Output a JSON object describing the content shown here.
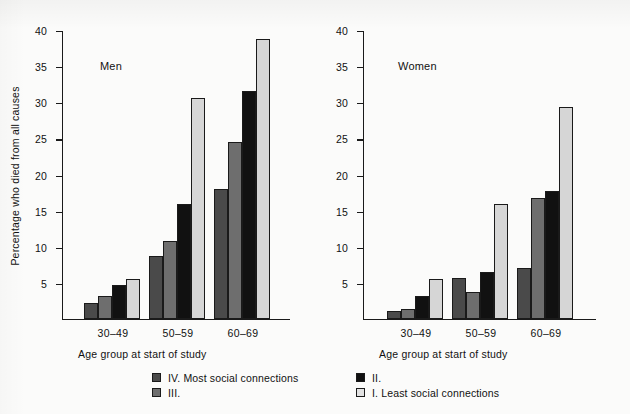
{
  "chart_data": {
    "type": "bar",
    "title": "",
    "xlabel": "Age group at start of study",
    "ylabel": "Percentage who died from all causes",
    "categories": [
      "30–49",
      "50–59",
      "60–69"
    ],
    "ylim": [
      0,
      40
    ],
    "yticks": [
      0,
      5,
      10,
      15,
      20,
      25,
      30,
      35,
      40
    ],
    "ytick_labels": [
      "",
      "5",
      "10",
      "15",
      "20",
      "25",
      "30",
      "35",
      "40"
    ],
    "grid": false,
    "legend_position": "bottom",
    "panels": [
      {
        "name": "Men",
        "series": [
          {
            "name": "IV. Most social connections",
            "values": [
              2.2,
              8.6,
              18.0
            ]
          },
          {
            "name": "III.",
            "values": [
              3.1,
              10.8,
              24.5
            ]
          },
          {
            "name": "II.",
            "values": [
              4.6,
              15.9,
              31.5
            ]
          },
          {
            "name": "I. Least social connections",
            "values": [
              5.5,
              30.5,
              38.7
            ]
          }
        ]
      },
      {
        "name": "Women",
        "series": [
          {
            "name": "IV. Most social connections",
            "values": [
              1.0,
              5.6,
              7.0
            ]
          },
          {
            "name": "III.",
            "values": [
              1.4,
              3.7,
              16.7
            ]
          },
          {
            "name": "II.",
            "values": [
              3.1,
              6.4,
              17.7
            ]
          },
          {
            "name": "I. Least social connections",
            "values": [
              5.5,
              15.8,
              29.3
            ]
          }
        ]
      }
    ],
    "legend": [
      {
        "label": "IV. Most social connections",
        "color": "#4a4a4a"
      },
      {
        "label": "II.",
        "color": "#111111"
      },
      {
        "label": "III.",
        "color": "#6e6e6e"
      },
      {
        "label": "I. Least social connections",
        "color": "#e2e2e2"
      }
    ]
  }
}
